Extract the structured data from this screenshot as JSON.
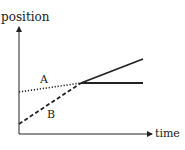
{
  "chart_data": {
    "type": "line",
    "title": "",
    "xlabel": "time",
    "ylabel": "position",
    "grid": false,
    "legend": "none",
    "xlim": [
      0,
      10
    ],
    "ylim": [
      0,
      10
    ],
    "annotations": [
      "A",
      "B"
    ],
    "series": [
      {
        "name": "A",
        "style": "dotted",
        "points": [
          [
            0,
            4
          ],
          [
            5,
            5
          ]
        ]
      },
      {
        "name": "B",
        "style": "dashed",
        "points": [
          [
            0,
            1
          ],
          [
            5,
            5
          ]
        ]
      },
      {
        "name": "after-rising",
        "style": "solid",
        "points": [
          [
            5,
            5
          ],
          [
            10,
            7
          ]
        ]
      },
      {
        "name": "after-flat",
        "style": "solid",
        "points": [
          [
            5,
            5
          ],
          [
            10,
            5
          ]
        ]
      }
    ]
  },
  "colors": {
    "ink": "#222222",
    "background": "#ffffff"
  }
}
